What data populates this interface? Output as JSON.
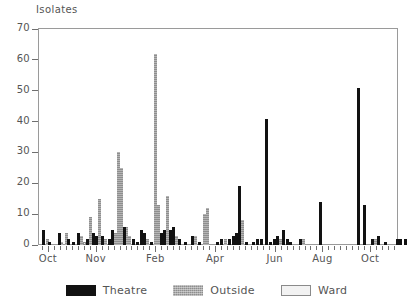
{
  "chart_data": {
    "type": "bar",
    "title": "Isolates",
    "ylabel": "Isolates",
    "xlabel": "",
    "ylim": [
      0,
      70
    ],
    "yticks": [
      0,
      10,
      20,
      30,
      40,
      50,
      60,
      70
    ],
    "grid": false,
    "legend_position": "bottom-center",
    "x_tick_count": 60,
    "x_tick_labels": [
      {
        "label": "Oct",
        "index": 1
      },
      {
        "label": "Nov",
        "index": 9
      },
      {
        "label": "Feb",
        "index": 19
      },
      {
        "label": "Apr",
        "index": 29
      },
      {
        "label": "Jun",
        "index": 39
      },
      {
        "label": "Aug",
        "index": 47
      },
      {
        "label": "Oct",
        "index": 55
      }
    ],
    "series": [
      {
        "name": "Theatre",
        "color": "#121212"
      },
      {
        "name": "Outside",
        "color": "#8e8e8e"
      },
      {
        "name": "Ward",
        "color": "#ededed"
      }
    ],
    "bars": [
      {
        "index": 0.2,
        "value": 5,
        "series": "Theatre"
      },
      {
        "index": 0.9,
        "value": 2,
        "series": "Outside"
      },
      {
        "index": 1.3,
        "value": 1,
        "series": "Theatre"
      },
      {
        "index": 2.9,
        "value": 4,
        "series": "Theatre"
      },
      {
        "index": 3.3,
        "value": 1,
        "series": "Outside"
      },
      {
        "index": 4.1,
        "value": 4,
        "series": "Outside"
      },
      {
        "index": 4.5,
        "value": 2,
        "series": "Theatre"
      },
      {
        "index": 5.3,
        "value": 1,
        "series": "Theatre"
      },
      {
        "index": 6.2,
        "value": 4,
        "series": "Theatre"
      },
      {
        "index": 6.6,
        "value": 3,
        "series": "Outside"
      },
      {
        "index": 7.1,
        "value": 1,
        "series": "Ward"
      },
      {
        "index": 7.7,
        "value": 2,
        "series": "Theatre"
      },
      {
        "index": 8.2,
        "value": 9,
        "series": "Outside"
      },
      {
        "index": 8.7,
        "value": 4,
        "series": "Theatre"
      },
      {
        "index": 9.2,
        "value": 3,
        "series": "Theatre"
      },
      {
        "index": 9.7,
        "value": 15,
        "series": "Outside"
      },
      {
        "index": 10.2,
        "value": 3,
        "series": "Theatre"
      },
      {
        "index": 10.7,
        "value": 2,
        "series": "Outside"
      },
      {
        "index": 11.3,
        "value": 2,
        "series": "Theatre"
      },
      {
        "index": 11.9,
        "value": 5,
        "series": "Theatre"
      },
      {
        "index": 12.4,
        "value": 4,
        "series": "Outside"
      },
      {
        "index": 12.9,
        "value": 30,
        "series": "Outside"
      },
      {
        "index": 13.3,
        "value": 25,
        "series": "Outside"
      },
      {
        "index": 13.8,
        "value": 6,
        "series": "Theatre"
      },
      {
        "index": 14.2,
        "value": 6,
        "series": "Outside"
      },
      {
        "index": 14.7,
        "value": 3,
        "series": "Outside"
      },
      {
        "index": 15.3,
        "value": 2,
        "series": "Theatre"
      },
      {
        "index": 16.0,
        "value": 1,
        "series": "Theatre"
      },
      {
        "index": 16.6,
        "value": 5,
        "series": "Theatre"
      },
      {
        "index": 17.1,
        "value": 4,
        "series": "Theatre"
      },
      {
        "index": 17.7,
        "value": 2,
        "series": "Outside"
      },
      {
        "index": 18.3,
        "value": 1,
        "series": "Theatre"
      },
      {
        "index": 19.0,
        "value": 62,
        "series": "Outside"
      },
      {
        "index": 19.5,
        "value": 13,
        "series": "Outside"
      },
      {
        "index": 20.0,
        "value": 4,
        "series": "Theatre"
      },
      {
        "index": 20.5,
        "value": 5,
        "series": "Theatre"
      },
      {
        "index": 21.0,
        "value": 16,
        "series": "Outside"
      },
      {
        "index": 21.5,
        "value": 5,
        "series": "Theatre"
      },
      {
        "index": 22.0,
        "value": 6,
        "series": "Theatre"
      },
      {
        "index": 22.5,
        "value": 3,
        "series": "Outside"
      },
      {
        "index": 23.1,
        "value": 2,
        "series": "Theatre"
      },
      {
        "index": 24.0,
        "value": 1,
        "series": "Theatre"
      },
      {
        "index": 25.2,
        "value": 3,
        "series": "Theatre"
      },
      {
        "index": 25.7,
        "value": 3,
        "series": "Outside"
      },
      {
        "index": 26.4,
        "value": 1,
        "series": "Theatre"
      },
      {
        "index": 27.2,
        "value": 10,
        "series": "Outside"
      },
      {
        "index": 27.7,
        "value": 12,
        "series": "Outside"
      },
      {
        "index": 29.4,
        "value": 1,
        "series": "Theatre"
      },
      {
        "index": 30.1,
        "value": 2,
        "series": "Theatre"
      },
      {
        "index": 30.8,
        "value": 2,
        "series": "Outside"
      },
      {
        "index": 31.5,
        "value": 2,
        "series": "Theatre"
      },
      {
        "index": 32.1,
        "value": 3,
        "series": "Theatre"
      },
      {
        "index": 32.6,
        "value": 4,
        "series": "Theatre"
      },
      {
        "index": 33.1,
        "value": 19,
        "series": "Theatre"
      },
      {
        "index": 33.6,
        "value": 8,
        "series": "Outside"
      },
      {
        "index": 34.3,
        "value": 1,
        "series": "Theatre"
      },
      {
        "index": 35.4,
        "value": 1,
        "series": "Theatre"
      },
      {
        "index": 36.1,
        "value": 2,
        "series": "Theatre"
      },
      {
        "index": 36.8,
        "value": 2,
        "series": "Theatre"
      },
      {
        "index": 37.6,
        "value": 41,
        "series": "Theatre"
      },
      {
        "index": 38.3,
        "value": 1,
        "series": "Theatre"
      },
      {
        "index": 39.0,
        "value": 2,
        "series": "Theatre"
      },
      {
        "index": 39.5,
        "value": 3,
        "series": "Theatre"
      },
      {
        "index": 40.0,
        "value": 2,
        "series": "Outside"
      },
      {
        "index": 40.5,
        "value": 5,
        "series": "Theatre"
      },
      {
        "index": 41.1,
        "value": 2,
        "series": "Theatre"
      },
      {
        "index": 41.7,
        "value": 1,
        "series": "Theatre"
      },
      {
        "index": 43.3,
        "value": 2,
        "series": "Theatre"
      },
      {
        "index": 43.8,
        "value": 2,
        "series": "Outside"
      },
      {
        "index": 46.6,
        "value": 14,
        "series": "Theatre"
      },
      {
        "index": 53.0,
        "value": 51,
        "series": "Theatre"
      },
      {
        "index": 54.0,
        "value": 13,
        "series": "Theatre"
      },
      {
        "index": 55.4,
        "value": 2,
        "series": "Theatre"
      },
      {
        "index": 55.9,
        "value": 2,
        "series": "Outside"
      },
      {
        "index": 56.4,
        "value": 3,
        "series": "Theatre"
      },
      {
        "index": 57.6,
        "value": 1,
        "series": "Theatre"
      },
      {
        "index": 59.6,
        "value": 2,
        "series": "Theatre"
      },
      {
        "index": 60.1,
        "value": 2,
        "series": "Theatre"
      },
      {
        "index": 60.9,
        "value": 2,
        "series": "Theatre"
      }
    ]
  },
  "legend": {
    "items": [
      {
        "label": "Theatre",
        "key": "theatre"
      },
      {
        "label": "Outside",
        "key": "outside"
      },
      {
        "label": "Ward",
        "key": "ward"
      }
    ]
  }
}
